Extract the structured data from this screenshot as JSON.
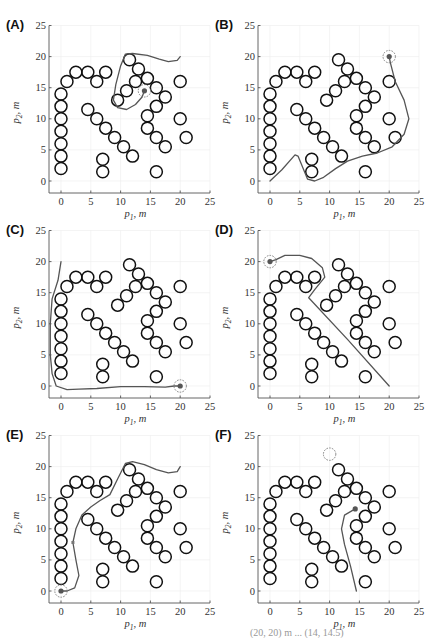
{
  "chart_data": [
    {
      "type": "scatter",
      "panel": "(A)",
      "xlabel": "p_1, m",
      "ylabel": "p_2, m",
      "xlim": [
        -2,
        25
      ],
      "ylim": [
        -2,
        25
      ],
      "xticks": [
        0,
        5,
        10,
        15,
        20,
        25
      ],
      "yticks": [
        0,
        5,
        10,
        15,
        20,
        25
      ],
      "grid": true,
      "robot": [
        14,
        14.5
      ],
      "goal": [
        14,
        14.5
      ],
      "trajectory": [
        [
          20,
          20
        ],
        [
          19.5,
          19.4
        ],
        [
          18,
          19.2
        ],
        [
          16.5,
          19.6
        ],
        [
          14.5,
          20.2
        ],
        [
          12,
          20.5
        ],
        [
          10.8,
          20.4
        ],
        [
          10,
          18.5
        ],
        [
          9.2,
          15.5
        ],
        [
          8.8,
          13
        ],
        [
          9.5,
          11.8
        ],
        [
          11,
          11.5
        ],
        [
          12.5,
          12.3
        ],
        [
          13.6,
          13.5
        ],
        [
          14,
          14.5
        ]
      ]
    },
    {
      "type": "scatter",
      "panel": "(B)",
      "xlabel": "p_1, m",
      "ylabel": "p_2, m",
      "xlim": [
        -2,
        25
      ],
      "ylim": [
        -2,
        25
      ],
      "xticks": [
        0,
        5,
        10,
        15,
        20,
        25
      ],
      "yticks": [
        0,
        5,
        10,
        15,
        20,
        25
      ],
      "grid": true,
      "robot": [
        20,
        20
      ],
      "goal": [
        20,
        20
      ],
      "trajectory": [
        [
          0,
          0
        ],
        [
          2,
          1.8
        ],
        [
          4.2,
          4.2
        ],
        [
          4.7,
          4
        ],
        [
          6.3,
          0.3
        ],
        [
          7.5,
          0
        ],
        [
          9,
          0.6
        ],
        [
          11,
          2
        ],
        [
          13,
          3.2
        ],
        [
          15.5,
          4
        ],
        [
          18,
          4.5
        ],
        [
          20.5,
          5.5
        ],
        [
          22.5,
          7.5
        ],
        [
          23.3,
          10
        ],
        [
          22.5,
          13
        ],
        [
          21,
          16
        ],
        [
          20.2,
          19
        ],
        [
          20,
          20
        ]
      ]
    },
    {
      "type": "scatter",
      "panel": "(C)",
      "xlabel": "p_1, m",
      "ylabel": "p_2, m",
      "xlim": [
        -2,
        25
      ],
      "ylim": [
        -2,
        25
      ],
      "xticks": [
        0,
        5,
        10,
        15,
        20,
        25
      ],
      "yticks": [
        0,
        5,
        10,
        15,
        20,
        25
      ],
      "grid": true,
      "robot": [
        20,
        0
      ],
      "goal": [
        20,
        0
      ],
      "trajectory": [
        [
          0,
          20
        ],
        [
          -0.5,
          17
        ],
        [
          -1.5,
          14
        ],
        [
          -1.8,
          10
        ],
        [
          -1.8,
          5
        ],
        [
          -1.5,
          2
        ],
        [
          -0.8,
          0
        ],
        [
          1,
          -0.6
        ],
        [
          3,
          -0.5
        ],
        [
          6,
          -0.4
        ],
        [
          10,
          -0.1
        ],
        [
          14,
          -0.1
        ],
        [
          17.5,
          -0.2
        ],
        [
          19,
          0
        ],
        [
          20,
          0
        ]
      ]
    },
    {
      "type": "scatter",
      "panel": "(D)",
      "xlabel": "p_1, m",
      "ylabel": "p_2, m",
      "xlim": [
        -2,
        25
      ],
      "ylim": [
        -2,
        25
      ],
      "xticks": [
        0,
        5,
        10,
        15,
        20,
        25
      ],
      "yticks": [
        0,
        5,
        10,
        15,
        20,
        25
      ],
      "grid": true,
      "robot": [
        0,
        20
      ],
      "goal": [
        0,
        20
      ],
      "trajectory": [
        [
          20,
          0
        ],
        [
          13,
          7.5
        ],
        [
          6.5,
          14.2
        ],
        [
          7.5,
          15.5
        ],
        [
          9.2,
          17.5
        ],
        [
          8.8,
          19
        ],
        [
          7,
          20.5
        ],
        [
          5,
          21
        ],
        [
          2.5,
          21
        ],
        [
          1,
          20.3
        ],
        [
          0,
          20
        ]
      ]
    },
    {
      "type": "scatter",
      "panel": "(E)",
      "xlabel": "p_1, m",
      "ylabel": "p_2, m",
      "xlim": [
        -2,
        25
      ],
      "ylim": [
        -2,
        25
      ],
      "xticks": [
        0,
        5,
        10,
        15,
        20,
        25
      ],
      "yticks": [
        0,
        5,
        10,
        15,
        20,
        25
      ],
      "grid": true,
      "robot": [
        0,
        0
      ],
      "goal": [
        0,
        0
      ],
      "waypoint": [
        2,
        7.8
      ],
      "trajectory": [
        [
          20,
          20
        ],
        [
          19.5,
          19.2
        ],
        [
          18,
          19
        ],
        [
          16,
          19.5
        ],
        [
          14,
          20.3
        ],
        [
          12,
          20.8
        ],
        [
          10.8,
          20.5
        ],
        [
          9.5,
          18
        ],
        [
          8.2,
          15.5
        ],
        [
          6.5,
          14.5
        ],
        [
          5,
          13.5
        ],
        [
          3.5,
          12.2
        ],
        [
          2.5,
          10
        ],
        [
          2,
          7.8
        ],
        [
          2.5,
          5
        ],
        [
          3,
          2.5
        ],
        [
          2.3,
          0.5
        ],
        [
          1,
          0
        ],
        [
          0,
          0
        ]
      ]
    },
    {
      "type": "scatter",
      "panel": "(F)",
      "xlabel": "p_1, m",
      "ylabel": "p_2, m",
      "xlim": [
        -2,
        25
      ],
      "ylim": [
        -2,
        25
      ],
      "xticks": [
        0,
        5,
        10,
        15,
        20,
        25
      ],
      "yticks": [
        0,
        5,
        10,
        15,
        20,
        25
      ],
      "grid": true,
      "robot": [
        14.3,
        13.2
      ],
      "goal": [
        10,
        22
      ],
      "trajectory": [
        [
          14.5,
          0
        ],
        [
          13.5,
          4
        ],
        [
          12.5,
          7.5
        ],
        [
          12,
          10
        ],
        [
          12.5,
          12.2
        ],
        [
          14.3,
          13.2
        ]
      ]
    }
  ],
  "obstacles": {
    "radius": 1,
    "centers": [
      [
        0,
        2
      ],
      [
        0,
        4
      ],
      [
        0,
        6
      ],
      [
        0,
        8
      ],
      [
        0,
        10
      ],
      [
        0,
        12
      ],
      [
        0,
        14
      ],
      [
        1,
        16
      ],
      [
        2.5,
        17.5
      ],
      [
        4.5,
        17.5
      ],
      [
        6,
        16
      ],
      [
        7.5,
        17.5
      ],
      [
        4.5,
        11.5
      ],
      [
        6,
        10
      ],
      [
        7.5,
        8.5
      ],
      [
        9,
        7
      ],
      [
        10.5,
        5.5
      ],
      [
        12,
        4
      ],
      [
        7,
        3.5
      ],
      [
        7,
        1.5
      ],
      [
        9.5,
        13
      ],
      [
        11,
        14.5
      ],
      [
        11.5,
        19.5
      ],
      [
        12.5,
        16
      ],
      [
        13,
        18
      ],
      [
        14.5,
        16.5
      ],
      [
        16,
        15
      ],
      [
        17.5,
        13.5
      ],
      [
        16,
        12
      ],
      [
        14.5,
        10.5
      ],
      [
        14.5,
        8.5
      ],
      [
        16,
        7
      ],
      [
        17.5,
        5.5
      ],
      [
        16,
        1.5
      ],
      [
        20,
        16
      ],
      [
        20,
        10
      ],
      [
        21,
        7
      ]
    ]
  },
  "panels": [
    {
      "label": "(A)",
      "x": 0,
      "y": 0
    },
    {
      "label": "(B)",
      "x": 209,
      "y": 0
    },
    {
      "label": "(C)",
      "x": 0,
      "y": 205
    },
    {
      "label": "(D)",
      "x": 209,
      "y": 205
    },
    {
      "label": "(E)",
      "x": 0,
      "y": 410
    },
    {
      "label": "(F)",
      "x": 209,
      "y": 410
    }
  ],
  "axes": {
    "xlabel_main": "p",
    "xlabel_sub": "1",
    "xlabel_unit": ", m",
    "ylabel_main": "p",
    "ylabel_sub": "2",
    "ylabel_unit": ", m"
  },
  "caption_fragment": "(20, 20) m ... (14, 14.5)"
}
